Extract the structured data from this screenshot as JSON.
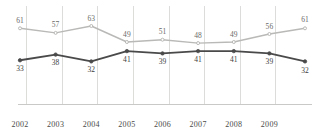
{
  "chart_data": {
    "type": "line",
    "title": "",
    "subtitle": "",
    "xlabel": "",
    "ylabel": "",
    "grid": true,
    "legend": "none",
    "ylim": [
      0,
      70
    ],
    "x_tick_labels": [
      "2002",
      "2003",
      "2004",
      "2005",
      "2006",
      "2007",
      "2008",
      "2009"
    ],
    "categories": [
      "2002",
      "2003",
      "2004",
      "2005",
      "2006",
      "2007",
      "2008",
      "2009",
      "2010"
    ],
    "series": [
      {
        "name": "upper-series",
        "color": "#b9b9b7",
        "marker": "circle-open",
        "label_position": "above",
        "values": [
          61,
          57,
          63,
          49,
          51,
          48,
          49,
          56,
          61
        ]
      },
      {
        "name": "lower-series",
        "color": "#4a4a4a",
        "marker": "circle-filled",
        "label_position": "below",
        "values": [
          33,
          38,
          32,
          41,
          39,
          41,
          41,
          39,
          32
        ]
      }
    ],
    "colors": {
      "upper_line": "#b9b9b7",
      "lower_line": "#4a4a4a",
      "gridline": "#dcdcda",
      "axis": "#c9c9c7",
      "label_text": "#52514f",
      "background": "#ffffff"
    }
  }
}
